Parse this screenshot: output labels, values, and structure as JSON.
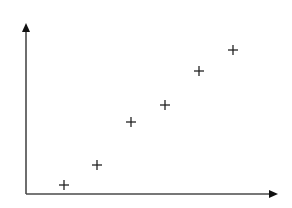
{
  "chart_data": {
    "type": "scatter",
    "title": "",
    "xlabel": "",
    "ylabel": "",
    "marker": "plus",
    "grid": false,
    "legend": null,
    "axes": {
      "x_ticks": [],
      "y_ticks": [],
      "arrows": true
    },
    "xlim": [
      0,
      252
    ],
    "ylim": [
      0,
      171
    ],
    "points": [
      {
        "x": 38,
        "y": 9
      },
      {
        "x": 71,
        "y": 29
      },
      {
        "x": 105,
        "y": 72
      },
      {
        "x": 139,
        "y": 89
      },
      {
        "x": 173,
        "y": 123
      },
      {
        "x": 207,
        "y": 144
      }
    ]
  },
  "style": {
    "axis_color": "#4a4a4a",
    "arrow_color": "#111111",
    "marker_color": "#222222",
    "background": "#ffffff"
  },
  "layout": {
    "origin_px": [
      26,
      194
    ],
    "x_axis_end_px": 278,
    "y_axis_end_px": 23,
    "marker_half_size_px": 5
  }
}
